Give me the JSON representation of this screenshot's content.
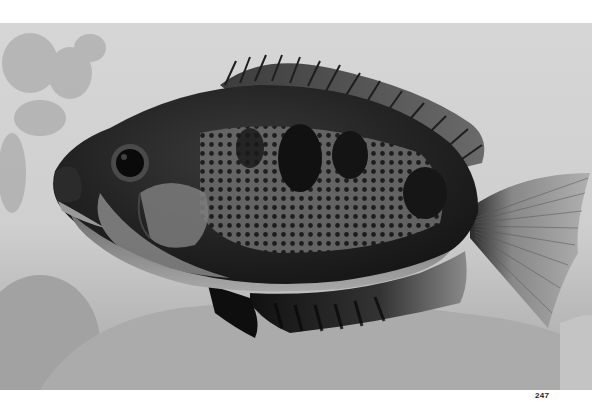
{
  "page": {
    "number": "247",
    "background_color": "#ffffff"
  },
  "photo": {
    "subject": "cichlid fish in side profile, facing left",
    "style": "black-and-white photograph",
    "colors": {
      "background_light": "#d4d4d4",
      "background_mid": "#b8b8b8",
      "rock": "#a9a9a9",
      "body_dark": "#1a1a1a",
      "body_mid": "#555555",
      "belly": "#9c9c9c",
      "fin_dark": "#111111",
      "tail_light": "#a5a5a5"
    }
  }
}
